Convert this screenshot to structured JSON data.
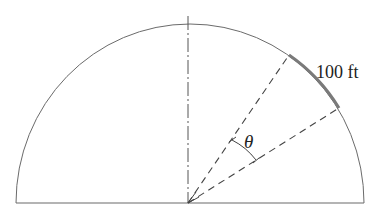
{
  "diagram": {
    "type": "semicircle-arc-angle",
    "labels": {
      "arc_length": "100 ft",
      "angle": "θ"
    },
    "colors": {
      "stroke": "#6b6b6b",
      "arc_highlight": "#7a7a7a",
      "background": "#ffffff"
    }
  }
}
